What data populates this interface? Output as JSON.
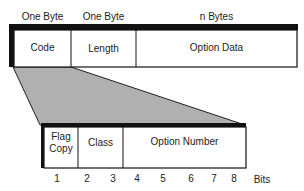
{
  "top_header": {
    "code": "One Byte",
    "length": "One Byte",
    "data": "n Bytes"
  },
  "top_fields": {
    "code": "Code",
    "length": "Length",
    "data": "Option Data"
  },
  "bottom_fields": {
    "flag_line1": "Flag",
    "flag_line2": "Copy",
    "class": "Class",
    "number": "Option Number"
  },
  "bits": {
    "b1": "1",
    "b2": "2",
    "b3": "3",
    "b4": "4",
    "b5": "5",
    "b6": "6",
    "b7": "7",
    "b8": "8",
    "label": "Bits"
  },
  "colors": {
    "line": "#111111",
    "fill": "#b0b0b0"
  }
}
